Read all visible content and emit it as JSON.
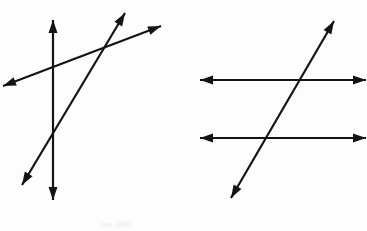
{
  "canvas": {
    "width": 367,
    "height": 231,
    "background": "#fdfdfd",
    "stroke_color": "#141414",
    "stroke_width": 2.2,
    "arrow_length": 13,
    "arrow_half_width": 4.5
  },
  "figures": [
    {
      "id": "intersecting-lines",
      "description": "Three pairwise intersecting lines, each with arrowheads on both ends",
      "lines": [
        {
          "name": "vertical-line",
          "x1": 53,
          "y1": 20,
          "x2": 53,
          "y2": 200
        },
        {
          "name": "shallow-rising-line",
          "x1": 3,
          "y1": 86,
          "x2": 161,
          "y2": 26
        },
        {
          "name": "steep-rising-line",
          "x1": 22,
          "y1": 185,
          "x2": 125,
          "y2": 13
        }
      ]
    },
    {
      "id": "parallel-lines-with-transversal",
      "description": "Two horizontal parallel lines crossed by a rising transversal, each with arrowheads on both ends",
      "lines": [
        {
          "name": "upper-horizontal-line",
          "x1": 200,
          "y1": 80,
          "x2": 366,
          "y2": 80
        },
        {
          "name": "lower-horizontal-line",
          "x1": 200,
          "y1": 138,
          "x2": 366,
          "y2": 138
        },
        {
          "name": "transversal-line",
          "x1": 231,
          "y1": 198,
          "x2": 334,
          "y2": 21
        }
      ]
    }
  ]
}
